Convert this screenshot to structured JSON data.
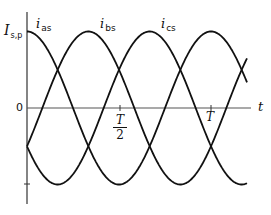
{
  "chart_data": {
    "type": "line",
    "title": "",
    "xlabel": "t",
    "ylabel": "I_s,p",
    "x_ticks": [
      {
        "value": 0,
        "label": "0 (origin)"
      },
      {
        "value": 0.5,
        "label": "T/2"
      },
      {
        "value": 1.0,
        "label": "T"
      }
    ],
    "y_ticks": [
      {
        "value": 1,
        "label": "I_s,p"
      },
      {
        "value": 0,
        "label": "0"
      },
      {
        "value": -1,
        "label": ""
      }
    ],
    "x_range_periods": [
      0,
      1.2
    ],
    "ylim": [
      -1,
      1
    ],
    "grid": false,
    "legend": "inline labels near peaks",
    "series": [
      {
        "name": "i_as",
        "label_main": "i",
        "label_sub": "as",
        "phase_deg": 0,
        "formula": "I_s,p * cos(2*pi*t/T)"
      },
      {
        "name": "i_bs",
        "label_main": "i",
        "label_sub": "bs",
        "phase_deg": -120,
        "formula": "I_s,p * cos(2*pi*t/T - 2*pi/3)"
      },
      {
        "name": "i_cs",
        "label_main": "i",
        "label_sub": "cs",
        "phase_deg": 120,
        "formula": "I_s,p * cos(2*pi*t/T + 2*pi/3)"
      }
    ],
    "samples": {
      "t_over_T": [
        0,
        0.1,
        0.2,
        0.3,
        0.4,
        0.5,
        0.6,
        0.7,
        0.8,
        0.9,
        1.0,
        1.1,
        1.2
      ],
      "i_as": [
        1.0,
        0.81,
        0.31,
        -0.31,
        -0.81,
        -1.0,
        -0.81,
        -0.31,
        0.31,
        0.81,
        1.0,
        0.81,
        0.31
      ],
      "i_bs": [
        -0.5,
        0.1,
        0.67,
        0.98,
        0.91,
        0.5,
        -0.1,
        -0.67,
        -0.98,
        -0.91,
        -0.5,
        0.1,
        0.67
      ],
      "i_cs": [
        -0.5,
        -0.91,
        -0.98,
        -0.67,
        -0.1,
        0.5,
        0.91,
        0.98,
        0.67,
        0.1,
        -0.5,
        -0.91,
        -0.98
      ]
    },
    "colors": {
      "curve": "#111111",
      "axis": "#333333"
    }
  },
  "labels": {
    "y_axis_main": "I",
    "y_axis_sub": "s,p",
    "zero": "0",
    "x_axis": "t",
    "half_period_num": "T",
    "half_period_den": "2",
    "period": "T",
    "ias_main": "i",
    "ias_sub": "as",
    "ibs_main": "i",
    "ibs_sub": "bs",
    "ics_main": "i",
    "ics_sub": "cs"
  }
}
